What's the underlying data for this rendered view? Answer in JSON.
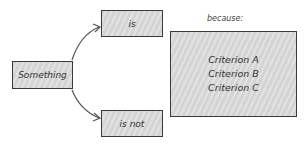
{
  "diagram": {
    "source_node": {
      "label": "Something"
    },
    "branch_top": {
      "label": "is"
    },
    "branch_bottom": {
      "label": "is not"
    },
    "reason_heading": "because:",
    "criteria": [
      "Criterion A",
      "Criterion B",
      "Criterion C"
    ],
    "colors": {
      "stroke": "#3a3a3a",
      "fill": "#d9d9d9",
      "text": "#333333"
    }
  }
}
